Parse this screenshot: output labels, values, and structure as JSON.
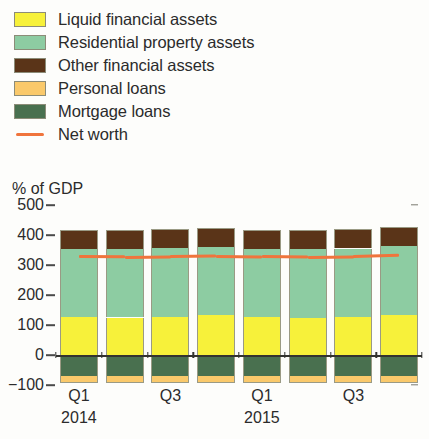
{
  "legend": {
    "items": [
      {
        "label": "Liquid financial assets",
        "color": "#f7f13a",
        "type": "swatch",
        "name": "liquid-financial-assets"
      },
      {
        "label": "Residential property assets",
        "color": "#8dcca2",
        "type": "swatch",
        "name": "residential-property-assets"
      },
      {
        "label": "Other financial assets",
        "color": "#5a3418",
        "type": "swatch",
        "name": "other-financial-assets"
      },
      {
        "label": "Personal loans",
        "color": "#fac96b",
        "type": "swatch",
        "name": "personal-loans"
      },
      {
        "label": "Mortgage loans",
        "color": "#49704f",
        "type": "swatch",
        "name": "mortgage-loans"
      },
      {
        "label": "Net worth",
        "color": "#f0743c",
        "type": "line",
        "name": "net-worth"
      }
    ]
  },
  "axis": {
    "unit_label": "% of GDP",
    "y_ticks": [
      500,
      400,
      300,
      200,
      100,
      0,
      -100
    ],
    "y_tick_labels": [
      "500",
      "400",
      "300",
      "200",
      "100",
      "0",
      "−100"
    ],
    "x_tick_labels": [
      "Q1",
      "Q3",
      "Q1",
      "Q3"
    ],
    "x_year_labels": [
      "2014",
      "",
      "2015",
      ""
    ]
  },
  "chart_data": {
    "type": "bar",
    "title": "",
    "subtitle": "",
    "xlabel": "",
    "ylabel": "% of GDP",
    "ylim": [
      -100,
      500
    ],
    "grid": false,
    "stacked": true,
    "legend_position": "top-left",
    "categories": [
      "Q1 2014",
      "Q2 2014",
      "Q3 2014",
      "Q4 2014",
      "Q1 2015",
      "Q2 2015",
      "Q3 2015",
      "Q4 2015"
    ],
    "x_axis_major_labels": [
      {
        "category": "Q1 2014",
        "label": "Q1",
        "year": "2014"
      },
      {
        "category": "Q3 2014",
        "label": "Q3",
        "year": ""
      },
      {
        "category": "Q1 2015",
        "label": "Q1",
        "year": "2015"
      },
      {
        "category": "Q3 2015",
        "label": "Q3",
        "year": ""
      }
    ],
    "series": [
      {
        "name": "Liquid financial assets",
        "color": "#f7f13a",
        "stack": "positive",
        "values": [
          127,
          125,
          128,
          133,
          126,
          124,
          126,
          132
        ]
      },
      {
        "name": "Residential property assets",
        "color": "#8dcca2",
        "stack": "positive",
        "values": [
          227,
          227,
          228,
          228,
          228,
          229,
          229,
          231
        ]
      },
      {
        "name": "Other financial assets",
        "color": "#5a3418",
        "stack": "positive",
        "values": [
          64,
          64,
          64,
          64,
          64,
          64,
          64,
          64
        ]
      },
      {
        "name": "Mortgage loans",
        "color": "#49704f",
        "stack": "negative",
        "values": [
          -71,
          -71,
          -71,
          -71,
          -71,
          -71,
          -71,
          -71
        ]
      },
      {
        "name": "Personal loans",
        "color": "#fac96b",
        "stack": "negative",
        "values": [
          -22,
          -22,
          -22,
          -22,
          -22,
          -22,
          -22,
          -22
        ]
      }
    ],
    "line_series": [
      {
        "name": "Net worth",
        "color": "#f0743c",
        "values": [
          332,
          331,
          333,
          335,
          333,
          331,
          333,
          337
        ]
      }
    ]
  }
}
